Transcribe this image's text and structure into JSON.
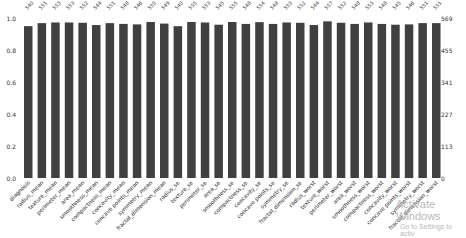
{
  "chart_data": {
    "type": "bar",
    "title": "",
    "xlabel": "",
    "ylabel": "",
    "ylim": [
      0,
      1.0
    ],
    "left_axis_ticks": [
      "0.0",
      "0.2",
      "0.4",
      "0.6",
      "0.8",
      "1.0"
    ],
    "right_axis_ticks": [
      "0",
      "113",
      "227",
      "341",
      "455",
      "569"
    ],
    "total_rows": 569,
    "grid": false,
    "categories": [
      "diagnosis",
      "radius_mean",
      "texture_mean",
      "perimeter_mean",
      "area_mean",
      "smoothness_mean",
      "compactness_mean",
      "concavity_mean",
      "concave points_mean",
      "symmetry_mean",
      "fractal_dimension_mean",
      "radius_se",
      "texture_se",
      "perimeter_se",
      "area_se",
      "smoothness_se",
      "compactness_se",
      "concavity_se",
      "concave points_se",
      "symmetry_se",
      "fractal_dimension_se",
      "radius_worst",
      "texture_worst",
      "perimeter_worst",
      "area_worst",
      "smoothness_worst",
      "compactness_worst",
      "concavity_worst",
      "concave points_worst",
      "symmetry_worst",
      "fractal_dimension_worst"
    ],
    "counts": [
      540,
      551,
      553,
      553,
      552,
      544,
      551,
      548,
      546,
      555,
      549,
      540,
      555,
      553,
      545,
      555,
      548,
      554,
      548,
      553,
      552,
      544,
      557,
      552,
      548,
      553,
      548,
      545,
      546,
      551,
      551
    ],
    "values": [
      0.949,
      0.968,
      0.972,
      0.972,
      0.97,
      0.956,
      0.968,
      0.963,
      0.96,
      0.975,
      0.965,
      0.949,
      0.975,
      0.972,
      0.958,
      0.975,
      0.963,
      0.974,
      0.963,
      0.972,
      0.97,
      0.956,
      0.979,
      0.97,
      0.963,
      0.972,
      0.963,
      0.958,
      0.96,
      0.968,
      0.968
    ],
    "bar_color": "#404040"
  },
  "watermark": {
    "line1": "Activate Windows",
    "line2": "Go to Settings to activ"
  }
}
